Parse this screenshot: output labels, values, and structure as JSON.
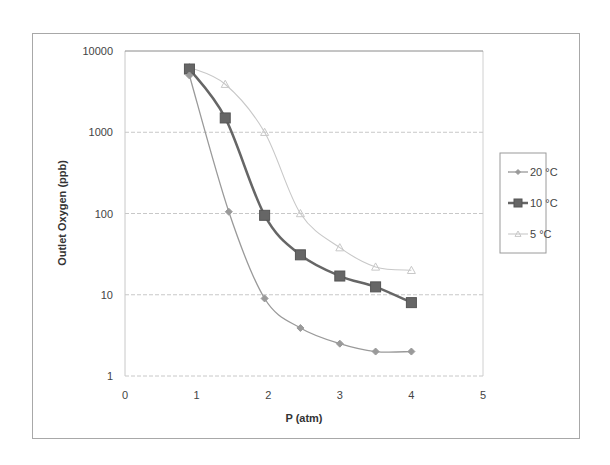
{
  "chart_data": {
    "type": "line",
    "title": "",
    "xlabel": "P (atm)",
    "ylabel": "Outlet Oxygen (ppb)",
    "xlim": [
      0,
      5
    ],
    "ylim": [
      1,
      10000
    ],
    "yscale": "log",
    "x_ticks": [
      "0",
      "1",
      "2",
      "3",
      "4",
      "5"
    ],
    "y_ticks": [
      "1",
      "10",
      "100",
      "1000",
      "10000"
    ],
    "grid": true,
    "legend_position": "right",
    "series": [
      {
        "name": "20 °C",
        "marker": "diamond",
        "color": "#9a9a9a",
        "x": [
          0.9,
          1.45,
          1.95,
          2.45,
          3.0,
          3.5,
          4.0
        ],
        "values": [
          5000,
          105,
          9,
          3.9,
          2.5,
          2.0,
          2.0
        ]
      },
      {
        "name": "10 °C",
        "marker": "square",
        "color": "#666666",
        "x": [
          0.9,
          1.4,
          1.95,
          2.45,
          3.0,
          3.5,
          4.0
        ],
        "values": [
          6000,
          1500,
          95,
          31,
          17,
          12.5,
          8
        ]
      },
      {
        "name": "5 °C",
        "marker": "triangle",
        "color": "#c8c8c8",
        "x": [
          0.9,
          1.4,
          1.95,
          2.45,
          3.0,
          3.5,
          4.0
        ],
        "values": [
          6300,
          3900,
          1000,
          100,
          38,
          22,
          20
        ]
      }
    ]
  }
}
